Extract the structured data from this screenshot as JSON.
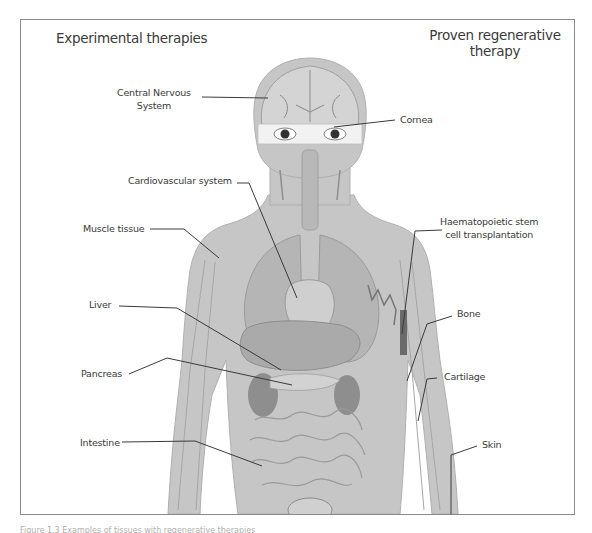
{
  "figure": {
    "heading_left": "Experimental therapies",
    "heading_right_line1": "Proven regenerative",
    "heading_right_line2": "therapy",
    "colors": {
      "frame": "#8a8a8a",
      "body_fill": "#c4c4c4",
      "body_outline": "#a8a8a8",
      "organ_dark": "#8e8e8e",
      "leader_line": "#3a3a3a",
      "text": "#3a3a3a"
    }
  },
  "labels": {
    "experimental": [
      {
        "id": "cns",
        "line1": "Central Nervous",
        "line2": "System"
      },
      {
        "id": "cardiovascular",
        "text": "Cardiovascular system"
      },
      {
        "id": "muscle",
        "text": "Muscle tissue"
      },
      {
        "id": "liver",
        "text": "Liver"
      },
      {
        "id": "pancreas",
        "text": "Pancreas"
      },
      {
        "id": "intestine",
        "text": "Intestine"
      }
    ],
    "proven": [
      {
        "id": "cornea",
        "text": "Cornea"
      },
      {
        "id": "hsct",
        "line1": "Haematopoietic stem",
        "line2": "cell transplantation"
      },
      {
        "id": "bone",
        "text": "Bone"
      },
      {
        "id": "cartilage",
        "text": "Cartilage"
      },
      {
        "id": "skin",
        "text": "Skin"
      }
    ]
  },
  "caption": "Figure 1.3 Examples of tissues with regenerative therapies"
}
